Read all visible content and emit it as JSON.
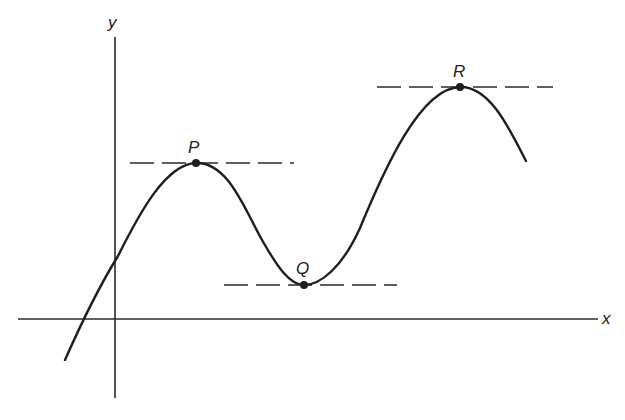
{
  "diagram": {
    "axes": {
      "x_label": "x",
      "y_label": "y"
    },
    "points": [
      {
        "label": "P",
        "kind": "local maximum"
      },
      {
        "label": "Q",
        "kind": "local minimum"
      },
      {
        "label": "R",
        "kind": "local maximum"
      }
    ],
    "tangent_lines": [
      {
        "at": "P",
        "style": "dashed",
        "orientation": "horizontal"
      },
      {
        "at": "Q",
        "style": "dashed",
        "orientation": "horizontal"
      },
      {
        "at": "R",
        "style": "dashed",
        "orientation": "horizontal"
      }
    ],
    "colors": {
      "line": "#1e1e1e",
      "background": "#ffffff"
    }
  }
}
